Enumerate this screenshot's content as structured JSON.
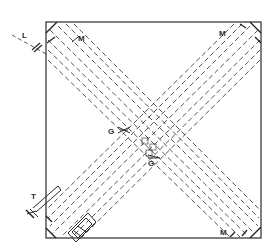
{
  "diagram": {
    "type": "optical interferometer schematic (crossed light paths in square frame)",
    "colors": {
      "ink": "#2a2a2a",
      "background": "#ffffff"
    },
    "labels": {
      "light_source": "L",
      "mirror_top_left": "M",
      "mirror_top_right": "M",
      "mirror_bottom_right": "M",
      "glass_plate_upper": "G",
      "glass_plate_lower": "G",
      "telescope": "T"
    },
    "components": [
      {
        "id": "frame",
        "desc": "square mounting frame"
      },
      {
        "id": "light-source-L",
        "desc": "incoming beam from upper-left"
      },
      {
        "id": "mirrors-M",
        "desc": "mirrors at three corners reflecting beams"
      },
      {
        "id": "glass-plates-G",
        "desc": "beam splitter / compensator plates at center"
      },
      {
        "id": "telescope-T",
        "desc": "observing telescope at lower-left"
      },
      {
        "id": "camera-box",
        "desc": "recording apparatus at lower-left corner"
      }
    ]
  }
}
